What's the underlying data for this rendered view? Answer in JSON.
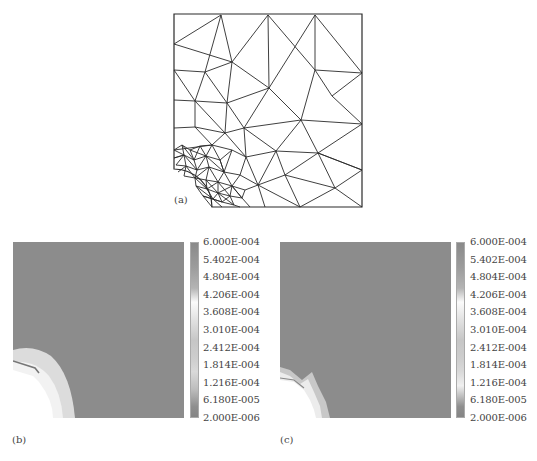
{
  "figure": {
    "panels": [
      {
        "id": "a",
        "label": "(a)",
        "type": "finite-element-mesh",
        "description": "triangular mesh of square plate with quarter-circle hole at lower-left, refined near hole"
      },
      {
        "id": "b",
        "label": "(b)",
        "type": "contour-plot"
      },
      {
        "id": "c",
        "label": "(c)",
        "type": "contour-plot"
      }
    ],
    "colorbar": {
      "ticks": [
        "6.000E-004",
        "5.402E-004",
        "4.804E-004",
        "4.206E-004",
        "3.608E-004",
        "3.010E-004",
        "2.412E-004",
        "1.814E-004",
        "1.216E-004",
        "6.180E-005",
        "2.000E-006"
      ],
      "max": 0.0006,
      "min": 2e-06
    },
    "colors": {
      "field": "#8c8c8c",
      "mesh_line": "#2a2a2a",
      "hole_region": "#ffffff"
    }
  }
}
